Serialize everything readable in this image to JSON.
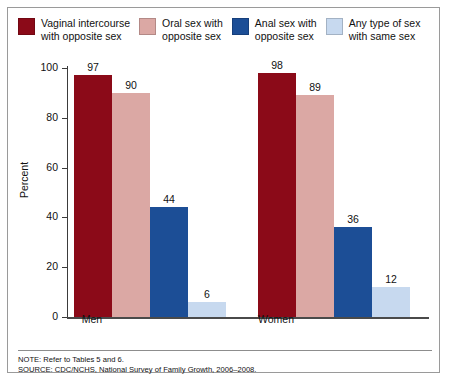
{
  "legend": {
    "items": [
      {
        "label": "Vaginal intercourse\nwith opposite sex",
        "color": "#8B0A18",
        "name": "vaginal-intercourse-opposite-sex"
      },
      {
        "label": "Oral sex with\nopposite sex",
        "color": "#DBA8A4",
        "name": "oral-sex-opposite-sex"
      },
      {
        "label": "Anal sex with\nopposite sex",
        "color": "#1C4E96",
        "name": "anal-sex-opposite-sex"
      },
      {
        "label": "Any type of sex\nwith same sex",
        "color": "#C7D9EF",
        "name": "any-sex-same-sex"
      }
    ]
  },
  "axes": {
    "ylabel": "Percent",
    "yticks": [
      "100",
      "80",
      "60",
      "40",
      "20",
      "0"
    ],
    "xticks": [
      "Men",
      "Women"
    ]
  },
  "footnotes": {
    "note": "NOTE: Refer to Tables 5 and 6.",
    "source": "SOURCE: CDC/NCHS, National Survey of Family Growth, 2006–2008."
  },
  "chart_data": {
    "type": "bar",
    "title": "",
    "xlabel": "",
    "ylabel": "Percent",
    "ylim": [
      0,
      100
    ],
    "yticks": [
      0,
      20,
      40,
      60,
      80,
      100
    ],
    "grid": false,
    "legend_position": "top",
    "categories": [
      "Men",
      "Women"
    ],
    "series": [
      {
        "name": "Vaginal intercourse with opposite sex",
        "color": "#8B0A18",
        "values": [
          97,
          98
        ]
      },
      {
        "name": "Oral sex with opposite sex",
        "color": "#DBA8A4",
        "values": [
          90,
          89
        ]
      },
      {
        "name": "Anal sex with opposite sex",
        "color": "#1C4E96",
        "values": [
          44,
          36
        ]
      },
      {
        "name": "Any type of sex with same sex",
        "color": "#C7D9EF",
        "values": [
          6,
          12
        ]
      }
    ]
  }
}
